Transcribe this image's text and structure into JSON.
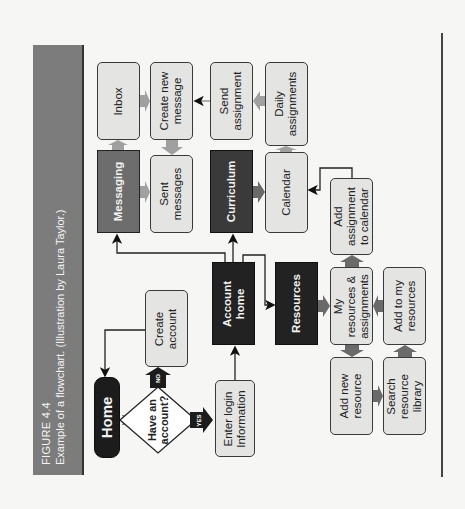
{
  "figure": {
    "number": "FIGURE 4.4",
    "caption": "Example of a flowchart. (Illustration by Laura Taylor.)"
  },
  "nodes": {
    "home": "Home",
    "decision": "Have an account?",
    "decision_yes": "YES",
    "decision_no": "NO",
    "create_account": "Create account",
    "enter_login": "Enter login information",
    "account_home": "Account home",
    "messaging": "Messaging",
    "inbox": "Inbox",
    "create_message": "Create new message",
    "sent_messages": "Sent messages",
    "curriculum": "Curriculum",
    "send_assignment": "Send assignment",
    "calendar": "Calendar",
    "daily_assignments": "Daily assignments",
    "resources": "Resources",
    "my_resources": "My resources & assignments",
    "add_to_calendar": "Add assignment to calendar",
    "add_to_my_resources": "Add to my resources",
    "add_new_resource": "Add new resource",
    "search_library": "Search resource library"
  },
  "labels_multiline": {
    "create_account": [
      "Create",
      "account"
    ],
    "enter_login": [
      "Enter login",
      "Information"
    ],
    "account_home": [
      "Account",
      "home"
    ],
    "create_message": [
      "Create new",
      "message"
    ],
    "sent_messages": [
      "Sent",
      "messages"
    ],
    "send_assignment": [
      "Send",
      "assignment"
    ],
    "daily_assignments": [
      "Daily",
      "assignments"
    ],
    "my_resources": [
      "My",
      "resources &",
      "assignments"
    ],
    "add_to_calendar": [
      "Add",
      "assignment",
      "to calendar"
    ],
    "add_to_my_resources": [
      "Add to my",
      "resources"
    ],
    "add_new_resource": [
      "Add new",
      "resource"
    ],
    "search_library": [
      "Search",
      "resource",
      "library"
    ],
    "decision": [
      "Have an",
      "account?"
    ]
  },
  "colors": {
    "title_band": "#7c7c7c",
    "dark_node": "#222222",
    "mid_node": "#6d6d6d",
    "light_node": "#e4e4e2",
    "arrow_gray": "#9a9a9a",
    "arrow_dark": "#555555",
    "background": "#f6f6f4"
  },
  "orientation": "rotated 90° counter-clockwise"
}
